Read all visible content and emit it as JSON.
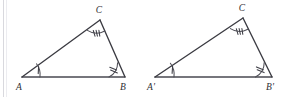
{
  "figure": {
    "background_color": "#ffffff",
    "stroke_color": "#3b3b42",
    "label_color": "#2e2e34",
    "width": 293,
    "height": 97
  },
  "triangles": [
    {
      "name": "triangle-abc",
      "vertices": [
        {
          "id": "A",
          "label": "A",
          "x": 22,
          "y": 77,
          "label_x": 19,
          "label_y": 90,
          "angle_marks": 1,
          "angle_mark_name": "single-tick"
        },
        {
          "id": "B",
          "label": "B",
          "x": 125,
          "y": 77,
          "label_x": 122,
          "label_y": 90,
          "angle_marks": 2,
          "angle_mark_name": "double-tick"
        },
        {
          "id": "C",
          "label": "C",
          "x": 100,
          "y": 20,
          "label_x": 97,
          "label_y": 13,
          "angle_marks": 3,
          "angle_mark_name": "triple-tick"
        }
      ]
    },
    {
      "name": "triangle-a-prime-b-prime-c",
      "vertices": [
        {
          "id": "A'",
          "label": "A'",
          "x": 155,
          "y": 77,
          "label_x": 150,
          "label_y": 90,
          "angle_marks": 1,
          "angle_mark_name": "single-tick"
        },
        {
          "id": "B'",
          "label": "B'",
          "x": 272,
          "y": 77,
          "label_x": 267,
          "label_y": 90,
          "angle_marks": 2,
          "angle_mark_name": "double-tick"
        },
        {
          "id": "C'",
          "label": "C",
          "x": 243,
          "y": 18,
          "label_x": 240,
          "label_y": 11,
          "angle_marks": 3,
          "angle_mark_name": "triple-tick"
        }
      ]
    }
  ],
  "labels": {
    "left_a": "A",
    "left_b": "B",
    "left_c": "C",
    "right_a": "A'",
    "right_b": "B'",
    "right_c": "C"
  }
}
